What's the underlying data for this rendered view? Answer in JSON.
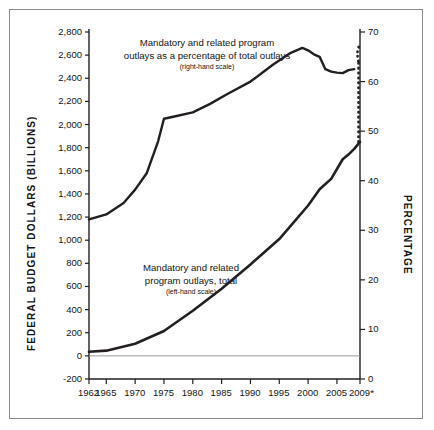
{
  "chart_data": {
    "type": "line",
    "title": "",
    "subtitle": "",
    "xlabel": "",
    "ylabel": "FEDERAL BUDGET DOLLARS (BILLIONS)",
    "y2label": "PERCENTAGE",
    "xlim": [
      1962,
      2009
    ],
    "ylim": [
      -200,
      2800
    ],
    "y2lim": [
      0,
      70
    ],
    "grid": false,
    "legend_position": "inline-annotations",
    "x_tick_labels": [
      "1962",
      "1965",
      "1970",
      "1975",
      "1980",
      "1985",
      "1990",
      "1995",
      "2000",
      "2005",
      "2009*"
    ],
    "x_tick_values": [
      1962,
      1965,
      1970,
      1975,
      1980,
      1985,
      1990,
      1995,
      2000,
      2005,
      2009
    ],
    "y_tick_labels": [
      "2,800",
      "2,600",
      "2,400",
      "2,200",
      "2,000",
      "1,800",
      "1,600",
      "1,400",
      "1,200",
      "1,000",
      "800",
      "600",
      "400",
      "200",
      "0",
      "-200"
    ],
    "y_tick_values": [
      2800,
      2600,
      2400,
      2200,
      2000,
      1800,
      1600,
      1400,
      1200,
      1000,
      800,
      600,
      400,
      200,
      0,
      -200
    ],
    "y2_tick_labels": [
      "70",
      "60",
      "50",
      "40",
      "30",
      "20",
      "10",
      "0"
    ],
    "y2_tick_values": [
      70,
      60,
      50,
      40,
      30,
      20,
      10,
      0
    ],
    "zero_line": 0,
    "annotations": [
      {
        "name": "percentage-series-label",
        "line1": "Mandatory and related program",
        "line2": "outlays as a percentage of total outlays",
        "scale_note": "(right-hand scale)",
        "x": 206,
        "y": 36
      },
      {
        "name": "dollars-series-label",
        "line1": "Mandatory and related",
        "line2": "program outlays, total",
        "scale_note": "(left-hand scale)",
        "x": 190,
        "y": 261
      }
    ],
    "series": [
      {
        "name": "Mandatory and related program outlays as a percentage of total outlays",
        "axis": "right",
        "unit": "percent",
        "style": "solid",
        "color": "#231f20",
        "x": [
          1962,
          1965,
          1968,
          1970,
          1972,
          1974,
          1975,
          1977,
          1980,
          1983,
          1986,
          1990,
          1994,
          1997,
          1999,
          2000,
          2001,
          2002,
          2003,
          2004,
          2005,
          2006,
          2007,
          2008
        ],
        "values": [
          32.2,
          33.2,
          35.5,
          38.2,
          41.5,
          48.0,
          52.5,
          53.0,
          53.8,
          55.5,
          57.5,
          60.0,
          63.5,
          65.8,
          66.8,
          66.3,
          65.5,
          65.0,
          62.5,
          62.0,
          61.8,
          61.7,
          62.3,
          62.5
        ]
      },
      {
        "name": "Mandatory and related program outlays as a percentage of total outlays (projected)",
        "axis": "right",
        "unit": "percent",
        "style": "dotted",
        "color": "#231f20",
        "x": [
          2008,
          2009
        ],
        "values": [
          62.5,
          67.3
        ]
      },
      {
        "name": "Mandatory and related program outlays, total",
        "axis": "left",
        "unit": "billions of dollars",
        "style": "solid",
        "color": "#231f20",
        "x": [
          1962,
          1965,
          1970,
          1975,
          1980,
          1985,
          1990,
          1995,
          2000,
          2002,
          2004,
          2006,
          2007,
          2008,
          2009
        ],
        "values": [
          35,
          45,
          105,
          215,
          390,
          580,
          790,
          1010,
          1300,
          1440,
          1530,
          1700,
          1740,
          1790,
          1850
        ]
      },
      {
        "name": "Projection connector",
        "axis": "none",
        "style": "dotted-vertical",
        "color": "#231f20",
        "note": "vertical dotted segment at 2009 joining the dollars curve to the percentage curve"
      }
    ]
  }
}
